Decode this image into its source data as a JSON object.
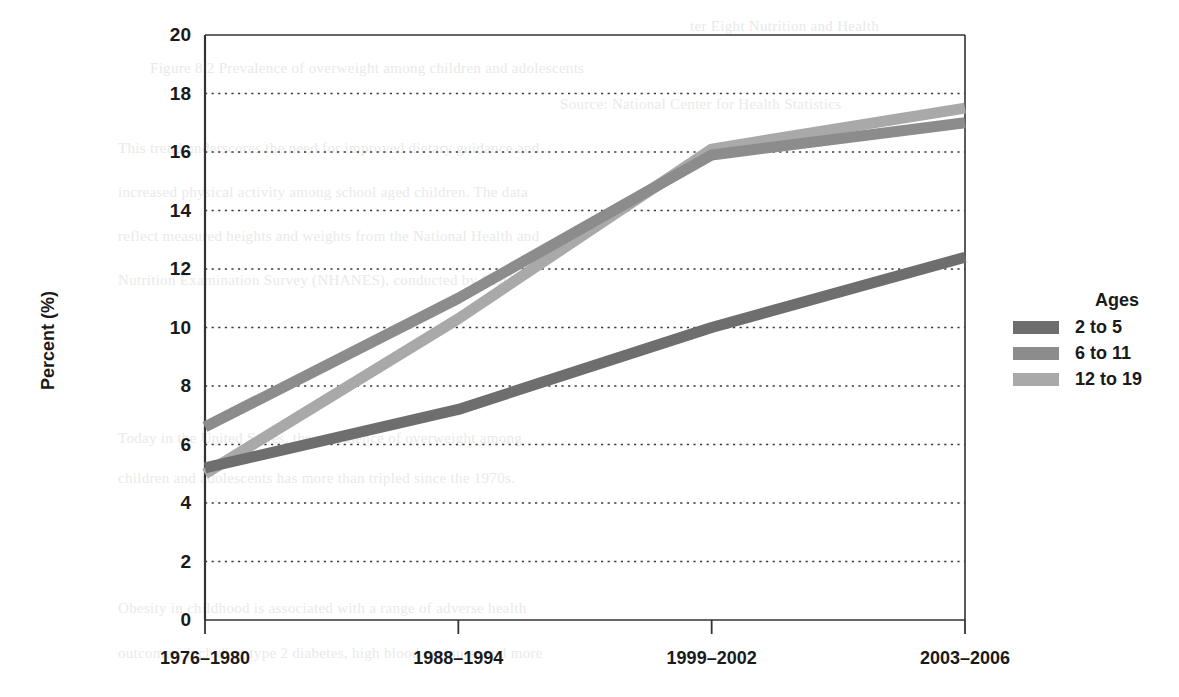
{
  "chart_data": {
    "type": "line",
    "title": "",
    "xlabel": "",
    "ylabel": "Percent (%)",
    "ylim": [
      0,
      20
    ],
    "ytick_step": 2,
    "grid": "horizontal-dotted",
    "legend_position": "right",
    "legend_title": "Ages",
    "categories": [
      "1976–1980",
      "1988–1994",
      "1999–2002",
      "2003–2006"
    ],
    "yticks": [
      "0",
      "2",
      "4",
      "6",
      "8",
      "10",
      "12",
      "14",
      "16",
      "18",
      "20"
    ],
    "series": [
      {
        "name": "2 to 5",
        "values": [
          5.2,
          7.2,
          10.0,
          12.4
        ],
        "color": "#6e6e6e"
      },
      {
        "name": "6 to 11",
        "values": [
          6.6,
          11.0,
          15.9,
          17.0
        ],
        "color": "#8c8c8c"
      },
      {
        "name": "12 to 19",
        "values": [
          5.0,
          10.3,
          16.1,
          17.5
        ],
        "color": "#a9a9a9"
      }
    ],
    "axis_color": "#333333",
    "grid_color": "#3a3a3a"
  },
  "legend": {
    "title": "Ages",
    "entries": [
      {
        "label": "2 to 5",
        "color": "#6e6e6e"
      },
      {
        "label": "6 to 11",
        "color": "#8c8c8c"
      },
      {
        "label": "12 to 19",
        "color": "#a9a9a9"
      }
    ]
  },
  "background_text": {
    "lines": [
      "ter Eight    Nutrition and Health",
      "Figure 8.2   Prevalence of overweight among children and adolescents",
      "Source: National Center for Health Statistics",
      "This trend underscores the need for improved dietary guidance and",
      "increased physical activity among school aged children. The data",
      "reflect measured heights and weights from the National Health and",
      "Nutrition Examination Survey (NHANES), conducted by CDC.",
      "Today in the United States, the prevalence of overweight among",
      "children and adolescents has more than tripled since the 1970s.",
      "Obesity in childhood is associated with a range of adverse health",
      "outcomes, including type 2 diabetes, high blood pressure, and more"
    ]
  }
}
